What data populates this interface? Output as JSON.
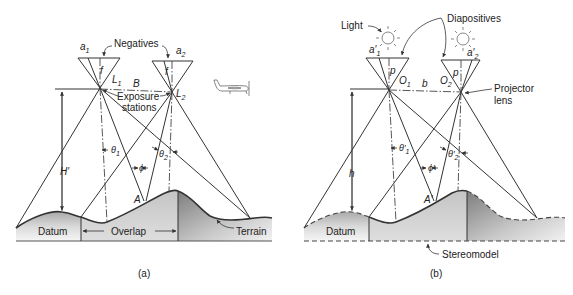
{
  "figure": {
    "panel_a": {
      "caption": "(a)",
      "labels": {
        "negatives": "Negatives",
        "a1": "a",
        "a1_sub": "1",
        "a2": "a",
        "a2_sub": "2",
        "f_left": "f",
        "f_right": "f",
        "L1": "L",
        "L1_sub": "1",
        "L2": "L",
        "L2_sub": "2",
        "B": "B",
        "exposure_stations_line1": "Exposure",
        "exposure_stations_line2": "stations",
        "H": "H′",
        "theta1": "θ",
        "theta1_sub": "1",
        "theta2": "θ",
        "theta2_sub": "2",
        "phi": "ϕ",
        "A": "A",
        "datum": "Datum",
        "overlap": "Overlap",
        "terrain": "Terrain",
        "plane_a": "a",
        "plane_b": "b"
      }
    },
    "panel_b": {
      "caption": "(b)",
      "labels": {
        "light": "Light",
        "diapositives": "Diapositives",
        "a1p": "a′",
        "a1p_sub": "1",
        "a2p": "a′",
        "a2p_sub": "2",
        "p_left": "p",
        "p_right": "p",
        "O1": "O",
        "O1_sub": "1",
        "O2": "O",
        "O2_sub": "2",
        "b": "b",
        "projector_line1": "Projector",
        "projector_line2": "lens",
        "h": "h",
        "theta1p": "θ′",
        "theta1p_sub": "1",
        "theta2p": "θ′",
        "theta2p_sub": "2",
        "phip": "ϕ′",
        "Ap": "A′",
        "datum": "Datum",
        "stereomodel": "Stereomodel"
      }
    },
    "colors": {
      "line": "#333333",
      "terrain_light": "#e6e6e6",
      "terrain_mid": "#c8c8c8",
      "terrain_dark": "#8c8c8c",
      "overlap_fill": "#d4d4d4",
      "background": "#ffffff"
    }
  }
}
